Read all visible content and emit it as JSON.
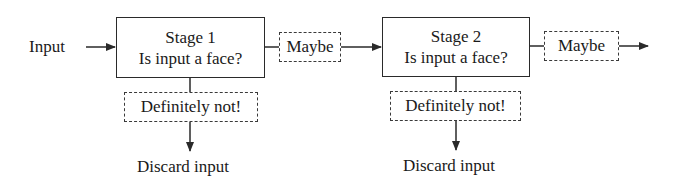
{
  "diagram": {
    "type": "cascade-classifier-flow",
    "input_label": "Input",
    "stages": [
      {
        "title": "Stage 1",
        "question": "Is input a face?",
        "pass_label": "Maybe",
        "reject_label": "Definitely not!",
        "reject_outcome": "Discard input"
      },
      {
        "title": "Stage 2",
        "question": "Is input a face?",
        "pass_label": "Maybe",
        "reject_label": "Definitely not!",
        "reject_outcome": "Discard input"
      }
    ],
    "colors": {
      "line": "#2a2a2a",
      "text": "#1a1a1a",
      "background": "#ffffff"
    }
  }
}
